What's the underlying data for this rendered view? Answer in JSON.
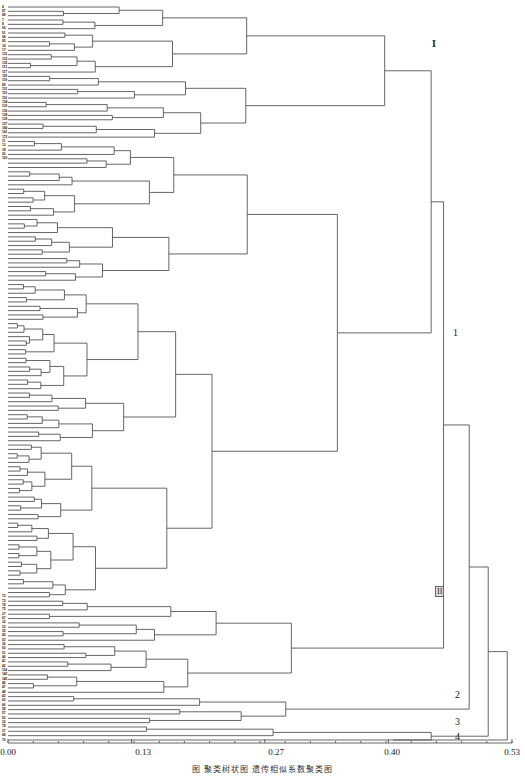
{
  "chart_data": {
    "type": "dendrogram",
    "title": "",
    "caption": "图 聚类树状图 遗传相似系数聚类图",
    "xlabel": "",
    "x_ticks": [
      "0.00",
      "0.13",
      "0.27",
      "0.40",
      "0.53"
    ],
    "x_range": [
      0.0,
      0.53
    ],
    "orientation": "horizontal, leaves on left, root on right",
    "leaf_count_approx": 170,
    "cluster_labels": [
      {
        "text": "I",
        "x": 0.435,
        "y_px": 46
      },
      {
        "text": "1",
        "x": 0.445,
        "y_px": 335
      },
      {
        "text": "II",
        "x": 0.44,
        "y_px": 593
      },
      {
        "text": "2",
        "x": 0.465,
        "y_px": 697
      },
      {
        "text": "3",
        "x": 0.46,
        "y_px": 724
      },
      {
        "text": "4",
        "x": 0.46,
        "y_px": 739
      }
    ],
    "visible_leaf_labels_top": [
      "4",
      "87",
      "88",
      "7",
      "8",
      "90",
      "91",
      "94",
      "95",
      "14",
      "17",
      "131",
      "132",
      "135",
      "113",
      "117",
      "118",
      "119",
      "89",
      "112",
      "115",
      "116",
      "134",
      "133",
      "136",
      "138",
      "139",
      "137",
      "140",
      "141",
      "172",
      "11",
      "13",
      "18",
      "20",
      "103"
    ],
    "visible_leaf_labels_bottom": [
      "72",
      "73",
      "74",
      "75",
      "27",
      "67",
      "32",
      "33",
      "35",
      "45",
      "53",
      "36",
      "50",
      "51",
      "40",
      "41",
      "42",
      "114",
      "142",
      "145",
      "46",
      "47",
      "48",
      "43",
      "63",
      "66",
      "58",
      "57",
      "52",
      "22",
      "78",
      "37",
      "68",
      "70"
    ]
  },
  "axis": {
    "tick_0": "0.00",
    "tick_1": "0.13",
    "tick_2": "0.27",
    "tick_3": "0.40",
    "tick_4": "0.53"
  },
  "labels": {
    "I": "I",
    "one": "1",
    "II": "II",
    "two": "2",
    "three": "3",
    "four": "4"
  },
  "caption": "图 聚类树状图 遗传相似系数聚类图",
  "colors": {
    "line": "#555555",
    "text": "#222222"
  }
}
